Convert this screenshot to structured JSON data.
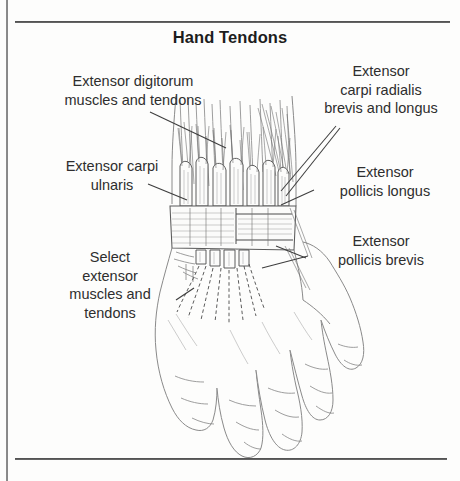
{
  "page": {
    "title": "Hand Tendons",
    "background_color": "#fdfdfc",
    "ink_color": "#2e2e2e"
  },
  "labels": {
    "extensor_digitorum": "Extensor digitorum\nmuscles and tendons",
    "extensor_carpi_ulnaris": "Extensor carpi\nulnaris",
    "select_extensor": "Select\nextensor\nmuscles and\ntendons",
    "extensor_carpi_radialis": "Extensor\ncarpi radialis\nbrevis and longus",
    "extensor_pollicis_longus": "Extensor\npollicis longus",
    "extensor_pollicis_brevis": "Extensor\npollicis brevis"
  },
  "illustration": {
    "name": "hand-tendons-anatomical-drawing",
    "subject": "dorsal view of right hand and wrist showing extensor retinaculum and extensor tendons",
    "style": "pen-and-ink line drawing"
  }
}
